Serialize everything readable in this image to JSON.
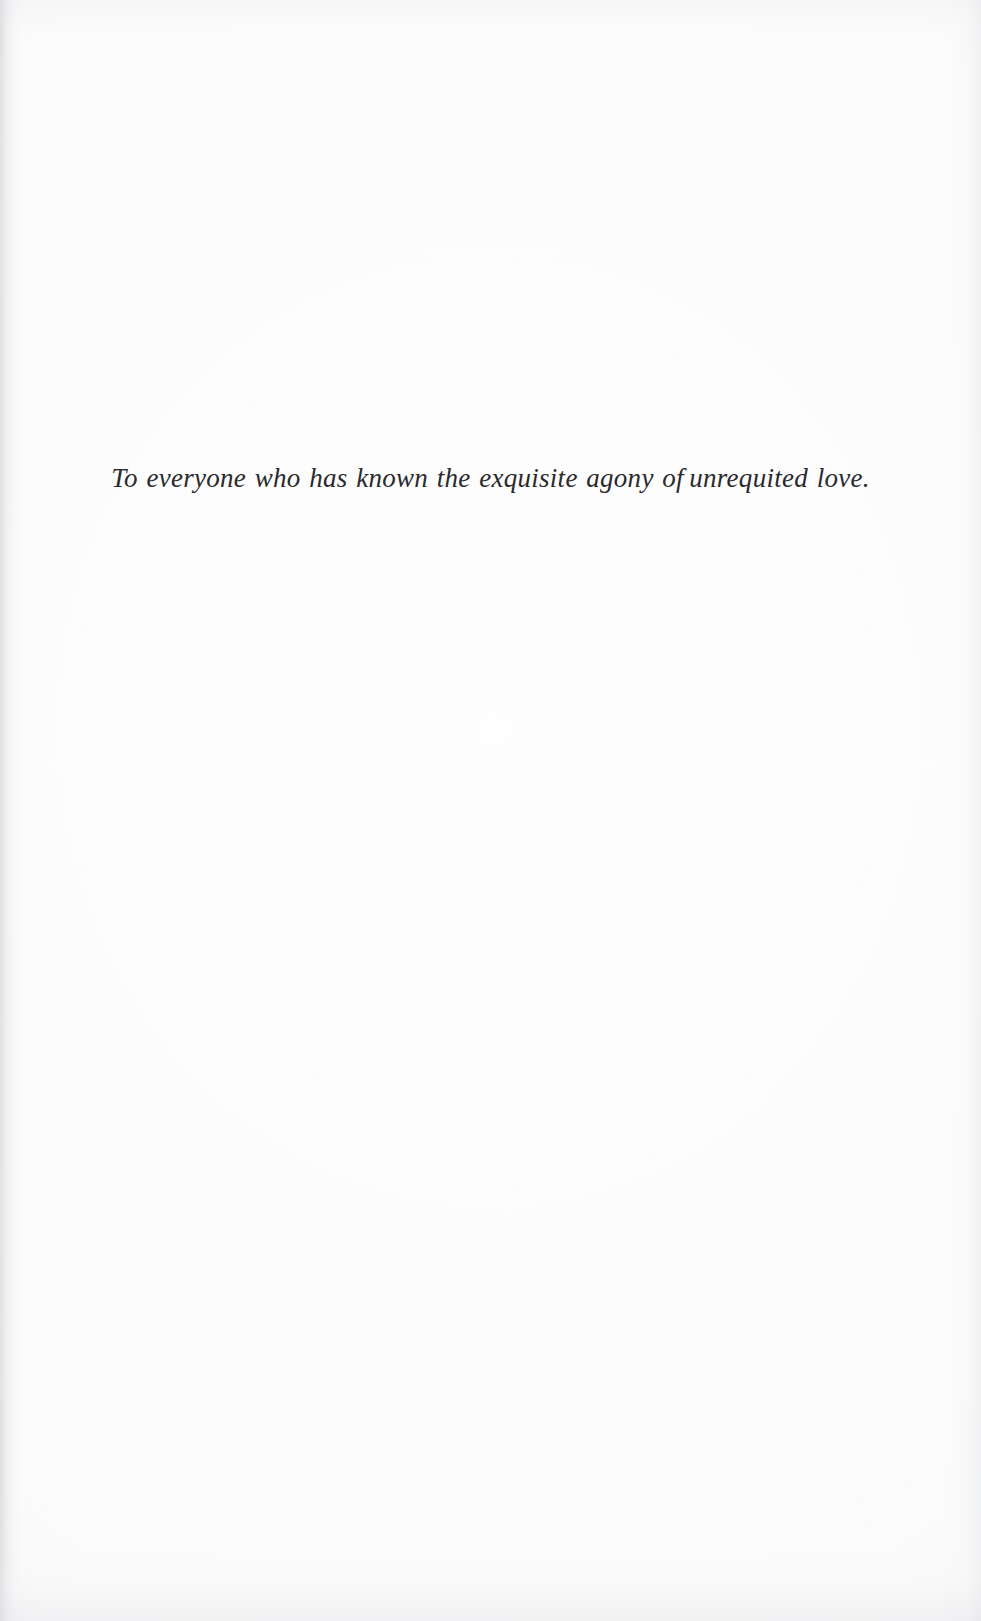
{
  "page": {
    "kind": "book-dedication-page",
    "width": 981,
    "height": 1621,
    "background_color": "#fefefe",
    "ink_color": "#2a2a2e"
  },
  "dedication": {
    "full_text": "To everyone who has known the exquisite agony of unrequited love.",
    "part_before_gap": "To everyone who has known the exquisite agony of",
    "part_after_gap": "unrequited love."
  }
}
